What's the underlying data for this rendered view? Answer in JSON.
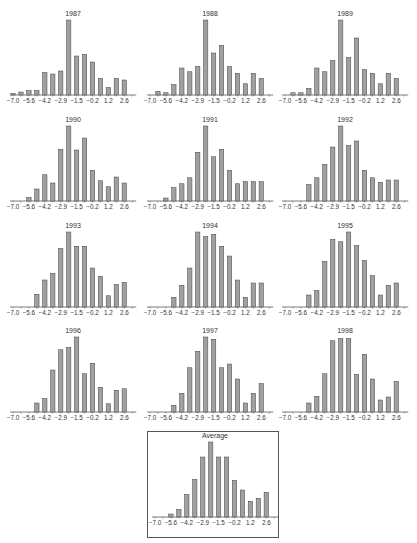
{
  "figure": {
    "bin_centers": [
      -7.0,
      -6.3,
      -5.6,
      -4.9,
      -4.2,
      -3.55,
      -2.9,
      -2.2,
      -1.5,
      -0.85,
      -0.2,
      0.5,
      1.2,
      1.9,
      2.6,
      3.3
    ],
    "tick_labels": [
      "-7.0",
      "-5.6",
      "-4.2",
      "-2.9",
      "-1.5",
      "-0.2",
      "1.2",
      "2.6"
    ],
    "bar_color": "#a0a0a0",
    "bar_edge_color": "#444444"
  },
  "chart_data": [
    {
      "type": "bar",
      "title": "1987",
      "categories": [
        "-7.0",
        "-6.3",
        "-5.6",
        "-4.9",
        "-4.2",
        "-3.55",
        "-2.9",
        "-2.2",
        "-1.5",
        "-0.85",
        "-0.2",
        "0.5",
        "1.2",
        "1.9",
        "2.6",
        "3.3"
      ],
      "values": [
        2,
        4,
        6,
        6,
        30,
        28,
        32,
        100,
        52,
        54,
        44,
        22,
        10,
        22,
        20,
        0
      ],
      "xlabel": "",
      "ylabel": "",
      "grid": false
    },
    {
      "type": "bar",
      "title": "1988",
      "categories": [
        "-7.0",
        "-6.3",
        "-5.6",
        "-4.9",
        "-4.2",
        "-3.55",
        "-2.9",
        "-2.2",
        "-1.5",
        "-0.85",
        "-0.2",
        "0.5",
        "1.2",
        "1.9",
        "2.6",
        "3.3"
      ],
      "values": [
        0,
        5,
        3,
        14,
        36,
        31,
        38,
        100,
        56,
        66,
        38,
        29,
        15,
        29,
        22,
        0
      ],
      "xlabel": "",
      "ylabel": "",
      "grid": false
    },
    {
      "type": "bar",
      "title": "1989",
      "categories": [
        "-7.0",
        "-6.3",
        "-5.6",
        "-4.9",
        "-4.2",
        "-3.55",
        "-2.9",
        "-2.2",
        "-1.5",
        "-0.85",
        "-0.2",
        "0.5",
        "1.2",
        "1.9",
        "2.6",
        "3.3"
      ],
      "values": [
        0,
        3,
        3,
        9,
        36,
        31,
        46,
        100,
        50,
        76,
        34,
        29,
        15,
        29,
        22,
        0
      ],
      "xlabel": "",
      "ylabel": "",
      "grid": false
    },
    {
      "type": "bar",
      "title": "1990",
      "categories": [
        "-7.0",
        "-6.3",
        "-5.6",
        "-4.9",
        "-4.2",
        "-3.55",
        "-2.9",
        "-2.2",
        "-1.5",
        "-0.85",
        "-0.2",
        "0.5",
        "1.2",
        "1.9",
        "2.6",
        "3.3"
      ],
      "values": [
        0,
        0,
        5,
        16,
        35,
        24,
        69,
        100,
        68,
        84,
        41,
        27,
        19,
        32,
        24,
        0
      ],
      "xlabel": "",
      "ylabel": "",
      "grid": false
    },
    {
      "type": "bar",
      "title": "1991",
      "categories": [
        "-7.0",
        "-6.3",
        "-5.6",
        "-4.9",
        "-4.2",
        "-3.55",
        "-2.9",
        "-2.2",
        "-1.5",
        "-0.85",
        "-0.2",
        "0.5",
        "1.2",
        "1.9",
        "2.6",
        "3.3"
      ],
      "values": [
        0,
        0,
        4,
        18,
        23,
        31,
        65,
        100,
        59,
        69,
        41,
        23,
        26,
        26,
        26,
        0
      ],
      "xlabel": "",
      "ylabel": "",
      "grid": false
    },
    {
      "type": "bar",
      "title": "1992",
      "categories": [
        "-7.0",
        "-6.3",
        "-5.6",
        "-4.9",
        "-4.2",
        "-3.55",
        "-2.9",
        "-2.2",
        "-1.5",
        "-0.85",
        "-0.2",
        "0.5",
        "1.2",
        "1.9",
        "2.6",
        "3.3"
      ],
      "values": [
        0,
        0,
        0,
        22,
        31,
        49,
        72,
        100,
        74,
        80,
        41,
        31,
        25,
        28,
        28,
        0
      ],
      "xlabel": "",
      "ylabel": "",
      "grid": false
    },
    {
      "type": "bar",
      "title": "1993",
      "categories": [
        "-7.0",
        "-6.3",
        "-5.6",
        "-4.9",
        "-4.2",
        "-3.55",
        "-2.9",
        "-2.2",
        "-1.5",
        "-0.85",
        "-0.2",
        "0.5",
        "1.2",
        "1.9",
        "2.6",
        "3.3"
      ],
      "values": [
        0,
        0,
        0,
        17,
        36,
        45,
        78,
        100,
        81,
        81,
        52,
        41,
        15,
        30,
        33,
        0
      ],
      "xlabel": "",
      "ylabel": "",
      "grid": false
    },
    {
      "type": "bar",
      "title": "1994",
      "categories": [
        "-7.0",
        "-6.3",
        "-5.6",
        "-4.9",
        "-4.2",
        "-3.55",
        "-2.9",
        "-2.2",
        "-1.5",
        "-0.85",
        "-0.2",
        "0.5",
        "1.2",
        "1.9",
        "2.6",
        "3.3"
      ],
      "values": [
        0,
        0,
        0,
        13,
        29,
        52,
        100,
        94,
        97,
        81,
        68,
        36,
        13,
        32,
        32,
        0
      ],
      "xlabel": "",
      "ylabel": "",
      "grid": false
    },
    {
      "type": "bar",
      "title": "1995",
      "categories": [
        "-7.0",
        "-6.3",
        "-5.6",
        "-4.9",
        "-4.2",
        "-3.55",
        "-2.9",
        "-2.2",
        "-1.5",
        "-0.85",
        "-0.2",
        "0.5",
        "1.2",
        "1.9",
        "2.6",
        "3.3"
      ],
      "values": [
        0,
        0,
        0,
        16,
        22,
        61,
        90,
        87,
        100,
        82,
        62,
        42,
        16,
        29,
        32,
        0
      ],
      "xlabel": "",
      "ylabel": "",
      "grid": false
    },
    {
      "type": "bar",
      "title": "1996",
      "categories": [
        "-7.0",
        "-6.3",
        "-5.6",
        "-4.9",
        "-4.2",
        "-3.55",
        "-2.9",
        "-2.2",
        "-1.5",
        "-0.85",
        "-0.2",
        "0.5",
        "1.2",
        "1.9",
        "2.6",
        "3.3"
      ],
      "values": [
        0,
        0,
        0,
        12,
        18,
        56,
        83,
        86,
        100,
        51,
        65,
        33,
        11,
        29,
        31,
        0
      ],
      "xlabel": "",
      "ylabel": "",
      "grid": false
    },
    {
      "type": "bar",
      "title": "1997",
      "categories": [
        "-7.0",
        "-6.3",
        "-5.6",
        "-4.9",
        "-4.2",
        "-3.55",
        "-2.9",
        "-2.2",
        "-1.5",
        "-0.85",
        "-0.2",
        "0.5",
        "1.2",
        "1.9",
        "2.6",
        "3.3"
      ],
      "values": [
        0,
        0,
        0,
        9,
        25,
        59,
        81,
        100,
        97,
        59,
        64,
        44,
        12,
        25,
        38,
        0
      ],
      "xlabel": "",
      "ylabel": "",
      "grid": false
    },
    {
      "type": "bar",
      "title": "1998",
      "categories": [
        "-7.0",
        "-6.3",
        "-5.6",
        "-4.9",
        "-4.2",
        "-3.55",
        "-2.9",
        "-2.2",
        "-1.5",
        "-0.85",
        "-0.2",
        "0.5",
        "1.2",
        "1.9",
        "2.6",
        "3.3"
      ],
      "values": [
        0,
        0,
        0,
        12,
        21,
        51,
        95,
        98,
        98,
        50,
        77,
        44,
        16,
        20,
        41,
        0
      ],
      "xlabel": "",
      "ylabel": "",
      "grid": false
    },
    {
      "type": "bar",
      "title": "Average",
      "categories": [
        "-7.0",
        "-6.3",
        "-5.6",
        "-4.9",
        "-4.2",
        "-3.55",
        "-2.9",
        "-2.2",
        "-1.5",
        "-0.85",
        "-0.2",
        "0.5",
        "1.2",
        "1.9",
        "2.6",
        "3.3"
      ],
      "values": [
        0,
        0,
        4,
        10,
        30,
        50,
        80,
        100,
        80,
        80,
        49,
        36,
        21,
        25,
        33,
        0
      ],
      "xlabel": "",
      "ylabel": "",
      "grid": false,
      "boxed": true
    }
  ]
}
